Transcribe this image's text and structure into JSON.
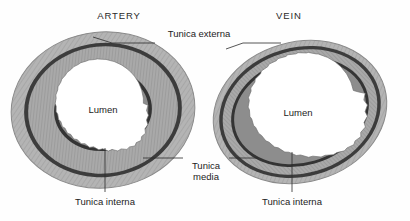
{
  "figure": {
    "kind": "anatomy-cross-section-diagram",
    "background": "#ffffff"
  },
  "titles": {
    "artery": "ARTERY",
    "vein": "VEIN"
  },
  "labels": {
    "tunica_externa": "Tunica externa",
    "tunica_media_line1": "Tunica",
    "tunica_media_line2": "media",
    "tunica_interna_artery": "Tunica interna",
    "tunica_interna_vein": "Tunica interna",
    "lumen_artery": "Lumen",
    "lumen_vein": "Lumen"
  },
  "colors": {
    "externa_fill": "#b3b3b3",
    "externa_edge": "#8f8f8f",
    "dark_band": "#3a3a3a",
    "media_fill": "#a8a8a8",
    "media_texture": "#9a9a9a",
    "interna_band": "#333333",
    "lumen_fill": "#ffffff",
    "text": "#1c1c1c",
    "leader": "#2b2b2b"
  },
  "vessels": [
    {
      "name": "artery",
      "shape": "circle",
      "center": [
        103,
        110
      ],
      "radii": [
        92,
        78
      ],
      "rotation": -6,
      "wall_thickness": "thick",
      "lumen_relative_size": "small",
      "layers": [
        {
          "name": "tunica-externa",
          "scale": 1.0
        },
        {
          "name": "external-elastic-lamina",
          "scale": 0.86
        },
        {
          "name": "tunica-media",
          "scale": 0.82
        },
        {
          "name": "internal-elastic-lamina",
          "scale": 0.54
        },
        {
          "name": "tunica-interna",
          "scale": 0.5
        },
        {
          "name": "lumen",
          "scale": 0.455
        }
      ]
    },
    {
      "name": "vein",
      "shape": "oval",
      "center": [
        300,
        112
      ],
      "radii": [
        88,
        74
      ],
      "rotation": -16,
      "wall_thickness": "thin",
      "lumen_relative_size": "large",
      "layers": [
        {
          "name": "tunica-externa",
          "scale": 1.0
        },
        {
          "name": "external-elastic-lamina",
          "scale": 0.93
        },
        {
          "name": "tunica-media",
          "scale": 0.89
        },
        {
          "name": "internal-elastic-lamina",
          "scale": 0.8
        },
        {
          "name": "tunica-interna",
          "scale": 0.77
        },
        {
          "name": "lumen",
          "scale": 0.74
        }
      ]
    }
  ]
}
